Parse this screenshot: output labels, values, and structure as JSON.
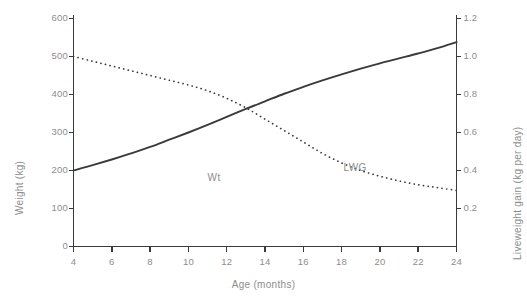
{
  "chart_data": {
    "type": "line",
    "title": "",
    "xlabel": "Age (months)",
    "ylabel": "Weight (kg)",
    "y2label": "Liveweight gain (kg per day)",
    "xlim": [
      4,
      24
    ],
    "ylim": [
      0,
      600
    ],
    "y2lim": [
      0,
      1.2
    ],
    "grid": false,
    "legend_position": "inline-annotations",
    "xticks": [
      "4",
      "6",
      "8",
      "10",
      "12",
      "14",
      "16",
      "18",
      "20",
      "22",
      "24"
    ],
    "xtick_values": [
      4,
      6,
      8,
      10,
      12,
      14,
      16,
      18,
      20,
      22,
      24
    ],
    "yticks": [
      "0",
      "100",
      "200",
      "300",
      "400",
      "500",
      "600"
    ],
    "ytick_values": [
      0,
      100,
      200,
      300,
      400,
      500,
      600
    ],
    "y2ticks": [
      "0.2",
      "0.4",
      "0.6",
      "0.8",
      "1.0",
      "1.2"
    ],
    "y2tick_values": [
      0.2,
      0.4,
      0.6,
      0.8,
      1.0,
      1.2
    ],
    "series": [
      {
        "name": "Wt",
        "label": "Wt",
        "axis": "left",
        "style": "solid",
        "color": "#3a3a3a",
        "x": [
          4,
          5,
          6,
          7,
          8,
          9,
          10,
          11,
          12,
          13,
          14,
          15,
          16,
          17,
          18,
          19,
          20,
          21,
          22,
          23,
          24
        ],
        "values": [
          200,
          214,
          229,
          245,
          262,
          281,
          300,
          320,
          341,
          362,
          382,
          402,
          420,
          437,
          453,
          468,
          482,
          495,
          508,
          522,
          538
        ]
      },
      {
        "name": "LWG",
        "label": "LWG",
        "axis": "right",
        "style": "dotted",
        "color": "#3a3a3a",
        "x": [
          4,
          5,
          6,
          7,
          8,
          9,
          10,
          11,
          12,
          13,
          14,
          15,
          16,
          17,
          18,
          19,
          20,
          21,
          22,
          23,
          24
        ],
        "values": [
          1.0,
          0.975,
          0.95,
          0.925,
          0.9,
          0.875,
          0.85,
          0.82,
          0.78,
          0.73,
          0.67,
          0.61,
          0.55,
          0.49,
          0.44,
          0.4,
          0.37,
          0.345,
          0.325,
          0.31,
          0.295
        ]
      }
    ],
    "annotations": [
      {
        "text": "Wt",
        "x": 11.0,
        "y_left": 178
      },
      {
        "text": "LWG",
        "x": 18.1,
        "y_left": 205
      }
    ]
  },
  "colors": {
    "axis": "#3a3a3a",
    "text": "#8d8d8d",
    "background": "#ffffff"
  }
}
